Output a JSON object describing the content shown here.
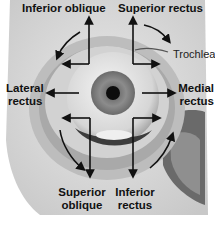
{
  "figure": {
    "colors": {
      "arrow": "#111111",
      "background": "#ffffff",
      "bone": "#dcdcdc",
      "iris": "#8a8a8a"
    },
    "labels": {
      "inferior_oblique": "Inferior oblique",
      "superior_rectus": "Superior rectus",
      "trochlea": "Trochlea",
      "lateral_rectus_1": "Lateral",
      "lateral_rectus_2": "rectus",
      "medial_rectus_1": "Medial",
      "medial_rectus_2": "rectus",
      "superior_oblique_1": "Superior",
      "superior_oblique_2": "oblique",
      "inferior_rectus_1": "Inferior",
      "inferior_rectus_2": "rectus"
    },
    "arrows": [
      {
        "muscle": "Inferior oblique",
        "direction": "up and out"
      },
      {
        "muscle": "Superior rectus",
        "direction": "up and in"
      },
      {
        "muscle": "Lateral rectus",
        "direction": "out"
      },
      {
        "muscle": "Medial rectus",
        "direction": "in"
      },
      {
        "muscle": "Superior oblique",
        "direction": "down and out"
      },
      {
        "muscle": "Inferior rectus",
        "direction": "down and in"
      }
    ]
  }
}
